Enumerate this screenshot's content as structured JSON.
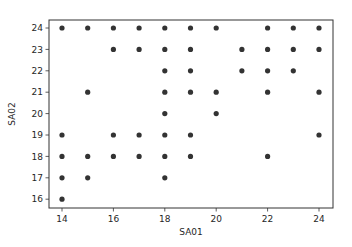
{
  "chart_data": {
    "type": "scatter",
    "title": "",
    "xlabel": "SA01",
    "ylabel": "SA02",
    "xlim": [
      13.5,
      24.5
    ],
    "ylim": [
      15.6,
      24.4
    ],
    "xticks": [
      14,
      16,
      18,
      20,
      22,
      24
    ],
    "yticks": [
      16,
      17,
      18,
      19,
      20,
      21,
      22,
      23,
      24
    ],
    "grid": false,
    "legend": null,
    "marker_color": "#333333",
    "points": [
      {
        "x": 14,
        "y": 24
      },
      {
        "x": 14,
        "y": 19
      },
      {
        "x": 14,
        "y": 18
      },
      {
        "x": 14,
        "y": 17
      },
      {
        "x": 14,
        "y": 16
      },
      {
        "x": 15,
        "y": 24
      },
      {
        "x": 15,
        "y": 21
      },
      {
        "x": 15,
        "y": 18
      },
      {
        "x": 15,
        "y": 17
      },
      {
        "x": 16,
        "y": 24
      },
      {
        "x": 16,
        "y": 23
      },
      {
        "x": 16,
        "y": 19
      },
      {
        "x": 16,
        "y": 18
      },
      {
        "x": 17,
        "y": 24
      },
      {
        "x": 17,
        "y": 23
      },
      {
        "x": 17,
        "y": 19
      },
      {
        "x": 17,
        "y": 18
      },
      {
        "x": 18,
        "y": 24
      },
      {
        "x": 18,
        "y": 23
      },
      {
        "x": 18,
        "y": 22
      },
      {
        "x": 18,
        "y": 21
      },
      {
        "x": 18,
        "y": 20
      },
      {
        "x": 18,
        "y": 19
      },
      {
        "x": 18,
        "y": 18
      },
      {
        "x": 18,
        "y": 17
      },
      {
        "x": 19,
        "y": 24
      },
      {
        "x": 19,
        "y": 23
      },
      {
        "x": 19,
        "y": 22
      },
      {
        "x": 19,
        "y": 21
      },
      {
        "x": 19,
        "y": 19
      },
      {
        "x": 19,
        "y": 18
      },
      {
        "x": 20,
        "y": 24
      },
      {
        "x": 20,
        "y": 21
      },
      {
        "x": 20,
        "y": 20
      },
      {
        "x": 21,
        "y": 23
      },
      {
        "x": 21,
        "y": 22
      },
      {
        "x": 22,
        "y": 24
      },
      {
        "x": 22,
        "y": 23
      },
      {
        "x": 22,
        "y": 22
      },
      {
        "x": 22,
        "y": 21
      },
      {
        "x": 22,
        "y": 18
      },
      {
        "x": 23,
        "y": 24
      },
      {
        "x": 23,
        "y": 23
      },
      {
        "x": 23,
        "y": 22
      },
      {
        "x": 24,
        "y": 24
      },
      {
        "x": 24,
        "y": 23
      },
      {
        "x": 24,
        "y": 21
      },
      {
        "x": 24,
        "y": 19
      }
    ]
  }
}
